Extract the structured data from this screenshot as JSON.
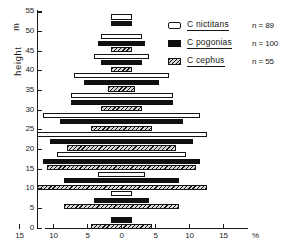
{
  "chart_data": {
    "type": "bar",
    "title": "",
    "xlabel": "%",
    "ylabel": "height",
    "ylabel_unit": "m",
    "orientation": "horizontal-symmetric-pyramid",
    "grid": false,
    "xlim": [
      -15,
      15
    ],
    "ylim": [
      0,
      55
    ],
    "x_ticks": [
      "15",
      "10",
      "5",
      "0",
      "5",
      "10",
      "15"
    ],
    "x_tick_values": [
      -15,
      -10,
      -5,
      0,
      5,
      10,
      15
    ],
    "x_unit_label": "%",
    "y_ticks": [
      "0",
      "5",
      "10",
      "15",
      "20",
      "25",
      "30",
      "35",
      "40",
      "45",
      "50",
      "55"
    ],
    "y_tick_values": [
      0,
      5,
      10,
      15,
      20,
      25,
      30,
      35,
      40,
      45,
      50,
      55
    ],
    "legend_position": "top-right",
    "series": [
      {
        "name": "C nictitans",
        "n_label": "n = 89",
        "n": 89,
        "pattern": "open",
        "heights": [
          2,
          7,
          12,
          17,
          22,
          27,
          32,
          37,
          42,
          47,
          52
        ],
        "values": [
          0.0,
          1.6,
          3.5,
          9.5,
          12.5,
          11.5,
          7.5,
          7.0,
          4.0,
          3.0,
          1.6
        ]
      },
      {
        "name": "C pogonias",
        "n_label": "n = 100",
        "n": 100,
        "pattern": "solid",
        "heights": [
          2,
          7,
          12,
          17,
          22,
          27,
          32,
          37,
          42,
          47,
          52
        ],
        "values": [
          1.5,
          4.0,
          8.5,
          11.5,
          10.5,
          9.0,
          7.5,
          5.5,
          3.0,
          3.5,
          1.6
        ]
      },
      {
        "name": "C cephus",
        "n_label": "n = 55",
        "n": 55,
        "pattern": "hatched",
        "heights": [
          2,
          7,
          12,
          17,
          22,
          27,
          32,
          37,
          42,
          47,
          52
        ],
        "values": [
          4.5,
          8.5,
          12.5,
          11.0,
          8.0,
          4.5,
          3.0,
          2.0,
          1.5,
          1.5,
          0.0
        ]
      }
    ]
  },
  "legend": {
    "items": [
      {
        "label": "C nictitans",
        "n": "n = 89",
        "swatch": "nictitans-swatch"
      },
      {
        "label": "C pogonias",
        "n": "n = 100",
        "swatch": "pogonias-swatch"
      },
      {
        "label": "C cephus",
        "n": "n = 55",
        "swatch": "cephus-swatch"
      }
    ]
  },
  "axes": {
    "y_title": "height",
    "y_unit": "m",
    "x_unit": "%"
  },
  "colors": {
    "ink": "#141414",
    "fill_solid": "#101010",
    "fill_open": "#ffffff",
    "hatch_bg": "#d8d8d8",
    "background": "#ffffff"
  }
}
